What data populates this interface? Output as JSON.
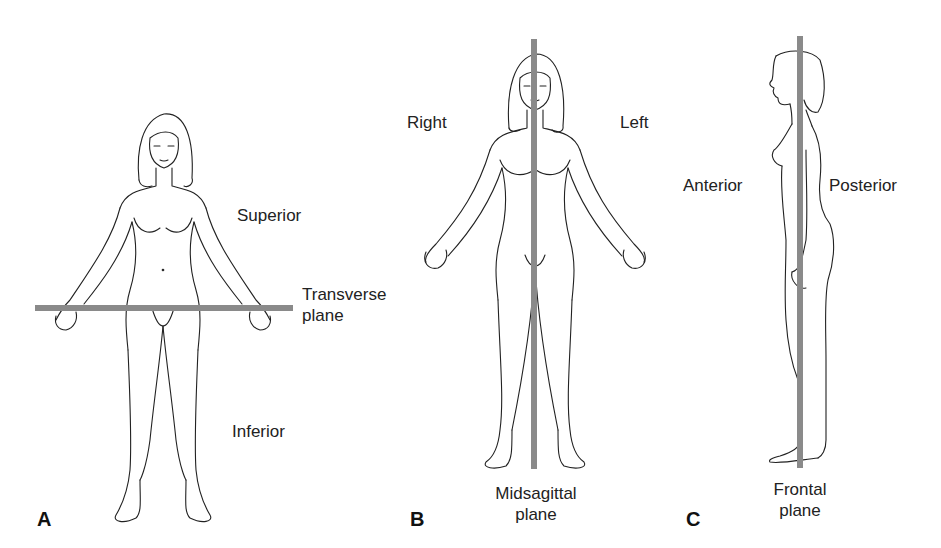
{
  "figure": {
    "plane_color": "#8a8a8a",
    "outline_color": "#222222",
    "panels": [
      {
        "letter": "A",
        "plane_name_line1": "Transverse",
        "plane_name_line2": "plane",
        "direction_labels": {
          "upper": "Superior",
          "lower": "Inferior"
        },
        "view": "anterior"
      },
      {
        "letter": "B",
        "plane_name_line1": "Midsagittal",
        "plane_name_line2": "plane",
        "direction_labels": {
          "left_side": "Right",
          "right_side": "Left"
        },
        "view": "anterior"
      },
      {
        "letter": "C",
        "plane_name_line1": "Frontal",
        "plane_name_line2": "plane",
        "direction_labels": {
          "front": "Anterior",
          "back": "Posterior"
        },
        "view": "lateral"
      }
    ]
  }
}
